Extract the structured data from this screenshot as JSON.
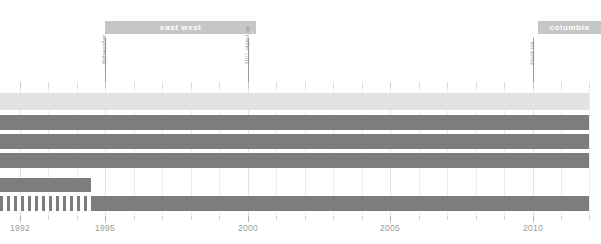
{
  "chart_data": {
    "type": "bar",
    "title": "",
    "subtitle": "",
    "xlabel": "",
    "ylabel": "",
    "xlim": [
      1991.3,
      2012.3
    ],
    "grid": true,
    "legend_position": "none",
    "orientation": "horizontal-timeline",
    "axis": {
      "tick_labels": [
        "1992",
        "1995",
        "2000",
        "2005",
        "2010"
      ],
      "tick_values": [
        1992,
        1995,
        2000,
        2005,
        2010
      ],
      "minor_tick_step": 1,
      "minor_tick_values": [
        1992,
        1993,
        1994,
        1995,
        1996,
        1997,
        1998,
        1999,
        2000,
        2001,
        2002,
        2003,
        2004,
        2005,
        2006,
        2007,
        2008,
        2009,
        2010,
        2011,
        2012
      ]
    },
    "groups": [
      {
        "label": "east west",
        "start": 1995.0,
        "end": 2000.3
      },
      {
        "label": "columbia",
        "start": 2010.2,
        "end": 2012.4
      }
    ],
    "annotations": [
      {
        "label": "dishwasher",
        "value": 1995.0
      },
      {
        "label": "2011 object up",
        "value": 2000.0
      },
      {
        "label": "black ice",
        "value": 2010.0
      }
    ],
    "series": [
      {
        "name": "row-1",
        "style": "light",
        "segments": [
          {
            "start": 1991.3,
            "end": 2012.0
          }
        ]
      },
      {
        "name": "row-2",
        "style": "dark",
        "segments": [
          {
            "start": 1991.3,
            "end": 2012.0
          }
        ]
      },
      {
        "name": "row-3",
        "style": "dark",
        "segments": [
          {
            "start": 1991.3,
            "end": 2012.0
          }
        ]
      },
      {
        "name": "row-4",
        "style": "dark",
        "segments": [
          {
            "start": 1991.3,
            "end": 2012.0
          }
        ]
      },
      {
        "name": "row-5",
        "style": "dark",
        "segments": [
          {
            "start": 1991.3,
            "end": 1994.5
          }
        ]
      },
      {
        "name": "row-6",
        "style": "mixed",
        "segments": [
          {
            "start": 1991.3,
            "end": 1994.5,
            "style": "hatch"
          },
          {
            "start": 1994.5,
            "end": 2012.0,
            "style": "dark"
          }
        ]
      }
    ],
    "colors": {
      "light_bar": "#e2e2e2",
      "dark_bar": "#7d7d7d",
      "group_bar": "#c6c6c6",
      "group_bar_text": "#ffffff",
      "gridline": "#ededed",
      "tick": "#cfcfcf",
      "tick_label": "#9b9b9b",
      "annotation_line": "#9a9a9a",
      "annotation_label": "#8e8e8e",
      "background": "#ffffff"
    }
  }
}
